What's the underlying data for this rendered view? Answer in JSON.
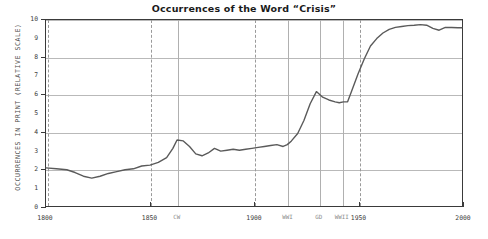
{
  "chart_data": {
    "type": "line",
    "title": "Occurrences of the Word “Crisis”",
    "xlabel": "",
    "ylabel": "OCCURRENCES IN PRINT (RELATIVE SCALE)",
    "xlim": [
      1800,
      2000
    ],
    "ylim": [
      0,
      10
    ],
    "grid": true,
    "legend": "none",
    "y_ticks": [
      0,
      1,
      2,
      3,
      4,
      5,
      6,
      7,
      8,
      9,
      10
    ],
    "y_tick_labels": [
      "0",
      "1",
      "2",
      "3",
      "4",
      "5",
      "6",
      "7",
      "8",
      "9",
      "10"
    ],
    "y_gridlines": [
      2,
      4,
      6,
      8,
      10
    ],
    "x_ticks": [
      1800,
      1850,
      1900,
      1950,
      2000
    ],
    "x_tick_labels": [
      "1800",
      "1850",
      "1900",
      "1950",
      "2000"
    ],
    "x_dashed_gridlines": [
      1800,
      1850,
      1900,
      1950,
      2000
    ],
    "event_markers": [
      {
        "label": "CW",
        "x": 1863
      },
      {
        "label": "WWI",
        "x": 1916
      },
      {
        "label": "GD",
        "x": 1931
      },
      {
        "label": "WWII",
        "x": 1942
      }
    ],
    "series": [
      {
        "name": "Occurrences of “crisis”",
        "color": "#5a5a5a",
        "x": [
          1800,
          1805,
          1810,
          1814,
          1818,
          1822,
          1826,
          1830,
          1834,
          1838,
          1842,
          1846,
          1850,
          1854,
          1858,
          1861,
          1863,
          1866,
          1869,
          1872,
          1875,
          1878,
          1881,
          1884,
          1887,
          1890,
          1893,
          1896,
          1899,
          1902,
          1905,
          1908,
          1911,
          1914,
          1916,
          1918,
          1921,
          1924,
          1927,
          1930,
          1933,
          1936,
          1939,
          1941,
          1943,
          1945,
          1947,
          1950,
          1953,
          1956,
          1959,
          1962,
          1965,
          1968,
          1971,
          1974,
          1977,
          1980,
          1983,
          1986,
          1989,
          1992,
          1995,
          1998,
          2000
        ],
        "y": [
          2.05,
          2.0,
          1.95,
          1.8,
          1.6,
          1.5,
          1.6,
          1.75,
          1.85,
          1.95,
          2.0,
          2.15,
          2.2,
          2.35,
          2.6,
          3.1,
          3.55,
          3.5,
          3.2,
          2.8,
          2.7,
          2.85,
          3.1,
          2.95,
          3.0,
          3.05,
          3.0,
          3.05,
          3.1,
          3.15,
          3.2,
          3.25,
          3.3,
          3.2,
          3.3,
          3.5,
          3.9,
          4.6,
          5.5,
          6.15,
          5.85,
          5.7,
          5.6,
          5.55,
          5.6,
          5.6,
          6.2,
          7.1,
          7.9,
          8.6,
          9.0,
          9.3,
          9.5,
          9.6,
          9.65,
          9.7,
          9.72,
          9.75,
          9.72,
          9.55,
          9.45,
          9.6,
          9.6,
          9.58,
          9.58
        ]
      }
    ]
  }
}
